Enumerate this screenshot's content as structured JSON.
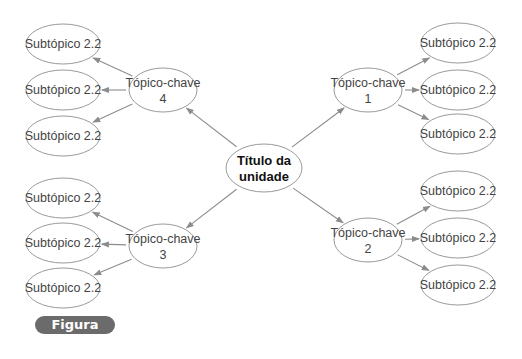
{
  "figure_label": "Figura 10.1",
  "center": {
    "line1": "Título da",
    "line2": "unidade",
    "cx": 264,
    "cy": 168,
    "rx": 38,
    "ry": 24
  },
  "topics": [
    {
      "id": "1",
      "line1": "Tópico-chave",
      "line2": "1",
      "cx": 368,
      "cy": 90,
      "side": "right",
      "subtopics": [
        {
          "label": "Subtópico 2.2",
          "cx": 458,
          "cy": 43
        },
        {
          "label": "Subtópico 2.2",
          "cx": 458,
          "cy": 90
        },
        {
          "label": "Subtópico 2.2",
          "cx": 458,
          "cy": 134
        }
      ]
    },
    {
      "id": "2",
      "line1": "Tópico-chave",
      "line2": "2",
      "cx": 368,
      "cy": 240,
      "side": "right",
      "subtopics": [
        {
          "label": "Subtópico 2.2",
          "cx": 458,
          "cy": 191
        },
        {
          "label": "Subtópico 2.2",
          "cx": 458,
          "cy": 238
        },
        {
          "label": "Subtópico 2.2",
          "cx": 458,
          "cy": 285
        }
      ]
    },
    {
      "id": "3",
      "line1": "Tópico-chave",
      "line2": "3",
      "cx": 163,
      "cy": 246,
      "side": "left",
      "subtopics": [
        {
          "label": "Subtópico 2.2",
          "cx": 63,
          "cy": 198
        },
        {
          "label": "Subtópico 2.2",
          "cx": 63,
          "cy": 243
        },
        {
          "label": "Subtópico 2.2",
          "cx": 63,
          "cy": 288
        }
      ]
    },
    {
      "id": "4",
      "line1": "Tópico-chave",
      "line2": "4",
      "cx": 163,
      "cy": 90,
      "side": "left",
      "subtopics": [
        {
          "label": "Subtópico 2.2",
          "cx": 63,
          "cy": 44
        },
        {
          "label": "Subtópico 2.2",
          "cx": 63,
          "cy": 90
        },
        {
          "label": "Subtópico 2.2",
          "cx": 63,
          "cy": 136
        }
      ]
    }
  ],
  "colors": {
    "stroke": "#9a9a9a",
    "arrow": "#8c8c8c",
    "label_bg": "#6b6b6b"
  }
}
